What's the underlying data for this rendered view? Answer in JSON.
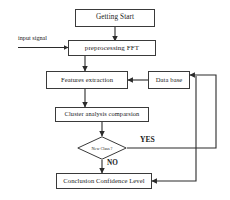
{
  "diagram": {
    "stroke_color": "#3a3a3a",
    "text_color": "#1a1a1a",
    "background": "#ffffff",
    "nodes": {
      "getting_start": "Getting  Start",
      "preprocessing": "preprocessing     FFT",
      "features_extraction": "Features extraction",
      "data_base": "Data base",
      "cluster_analysis": "Cluster analysis comparsion",
      "decision": "New Class ?",
      "conclusion": "Conclusion Confidence Level"
    },
    "labels": {
      "input_signal": "input signal",
      "yes": "YES",
      "no": "NO"
    }
  }
}
